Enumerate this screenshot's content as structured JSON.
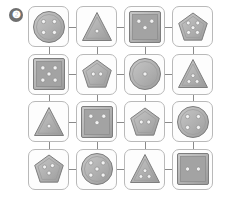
{
  "badge": {
    "label": "❷",
    "number": 2,
    "color": "#6f6f6f"
  },
  "puzzle": {
    "type": "shape-dot-grid",
    "rows": 4,
    "cols": 4,
    "shape_names": [
      "circle",
      "triangle",
      "square",
      "pentagon"
    ],
    "colors": {
      "card_border": "#b9b9b9",
      "card_fill": "#fdfdfd",
      "connector": "#8a8a8a",
      "shape_fill": "#b0b0b0",
      "shape_stroke": "#7d7d7d",
      "dot_fill": "#f2f2f2",
      "dot_stroke": "#8f8f8f"
    },
    "cells": [
      {
        "id": "r1c1",
        "row": 1,
        "col": 1,
        "shape": "circle",
        "dots": 4,
        "label": "circle-4-dots"
      },
      {
        "id": "r1c2",
        "row": 1,
        "col": 2,
        "shape": "triangle",
        "dots": 1,
        "label": "triangle-1-dot"
      },
      {
        "id": "r1c3",
        "row": 1,
        "col": 3,
        "shape": "square",
        "dots": 3,
        "label": "square-3-dots"
      },
      {
        "id": "r1c4",
        "row": 1,
        "col": 4,
        "shape": "pentagon",
        "dots": 5,
        "label": "pentagon-5-dots"
      },
      {
        "id": "r2c1",
        "row": 2,
        "col": 1,
        "shape": "square",
        "dots": 5,
        "label": "square-5-dots"
      },
      {
        "id": "r2c2",
        "row": 2,
        "col": 2,
        "shape": "pentagon",
        "dots": 2,
        "label": "pentagon-2-dots"
      },
      {
        "id": "r2c3",
        "row": 2,
        "col": 3,
        "shape": "circle",
        "dots": 1,
        "label": "circle-1-dot"
      },
      {
        "id": "r2c4",
        "row": 2,
        "col": 4,
        "shape": "triangle",
        "dots": 3,
        "label": "triangle-3-dots"
      },
      {
        "id": "r3c1",
        "row": 3,
        "col": 1,
        "shape": "triangle",
        "dots": 1,
        "label": "triangle-1-dot"
      },
      {
        "id": "r3c2",
        "row": 3,
        "col": 2,
        "shape": "square",
        "dots": 3,
        "label": "square-3-dots"
      },
      {
        "id": "r3c3",
        "row": 3,
        "col": 3,
        "shape": "pentagon",
        "dots": 2,
        "label": "pentagon-2-dots"
      },
      {
        "id": "r3c4",
        "row": 3,
        "col": 4,
        "shape": "circle",
        "dots": 4,
        "label": "circle-4-dots"
      },
      {
        "id": "r4c1",
        "row": 4,
        "col": 1,
        "shape": "pentagon",
        "dots": 3,
        "label": "pentagon-3-dots"
      },
      {
        "id": "r4c2",
        "row": 4,
        "col": 2,
        "shape": "circle",
        "dots": 5,
        "label": "circle-5-dots"
      },
      {
        "id": "r4c3",
        "row": 4,
        "col": 3,
        "shape": "triangle",
        "dots": 3,
        "label": "triangle-3-dots"
      },
      {
        "id": "r4c4",
        "row": 4,
        "col": 4,
        "shape": "square",
        "dots": 2,
        "label": "square-2-dots"
      }
    ]
  }
}
